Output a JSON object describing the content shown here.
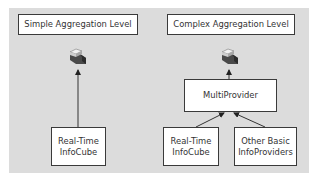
{
  "diagram": {
    "left": {
      "title": "Simple Aggregation Level",
      "icon": "infocube-query-icon",
      "source": "Real-Time\nInfoCube"
    },
    "right": {
      "title": "Complex Aggregation Level",
      "icon": "infocube-query-icon",
      "middle": "MultiProvider",
      "sources": [
        "Real-Time\nInfoCube",
        "Other Basic\nInfoProviders"
      ]
    }
  },
  "colors": {
    "panel": "#dcdcdc",
    "box_border": "#3a3a3a",
    "box_fill": "#ffffff"
  }
}
